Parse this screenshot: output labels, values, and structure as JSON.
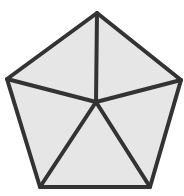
{
  "diagram": {
    "shape": "pentagon subdivided into five triangles from an interior point",
    "fill_color": "#e6e6e6",
    "stroke_color": "#333333",
    "stroke_width": 4,
    "vertices": {
      "top": [
        97,
        13
      ],
      "right": [
        181,
        80
      ],
      "bottom_right": [
        150,
        187
      ],
      "bottom_left": [
        40,
        187
      ],
      "left": [
        7,
        79
      ]
    },
    "center": [
      96,
      102
    ]
  }
}
